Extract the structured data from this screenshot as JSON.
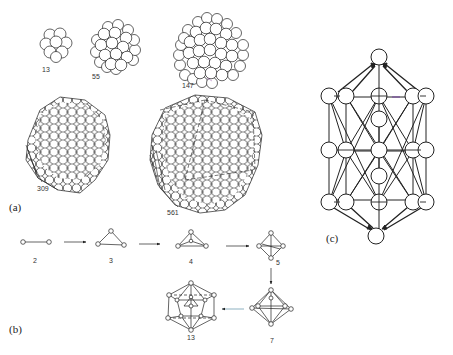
{
  "figure": {
    "panels": {
      "a": {
        "label": "(a)",
        "clusters": [
          {
            "size_label": "13"
          },
          {
            "size_label": "55"
          },
          {
            "size_label": "147"
          },
          {
            "size_label": "309"
          },
          {
            "size_label": "561"
          }
        ]
      },
      "b": {
        "label": "(b)",
        "steps": [
          {
            "size_label": "2"
          },
          {
            "size_label": "3"
          },
          {
            "size_label": "4"
          },
          {
            "size_label": "5"
          },
          {
            "size_label": "7"
          },
          {
            "size_label": "13"
          }
        ]
      },
      "c": {
        "label": "(c)"
      }
    },
    "colors": {
      "ink": "#222222",
      "background": "#ffffff",
      "accent_line": "#7a4fa0",
      "arrow_tint": "#5b8fa8"
    }
  }
}
